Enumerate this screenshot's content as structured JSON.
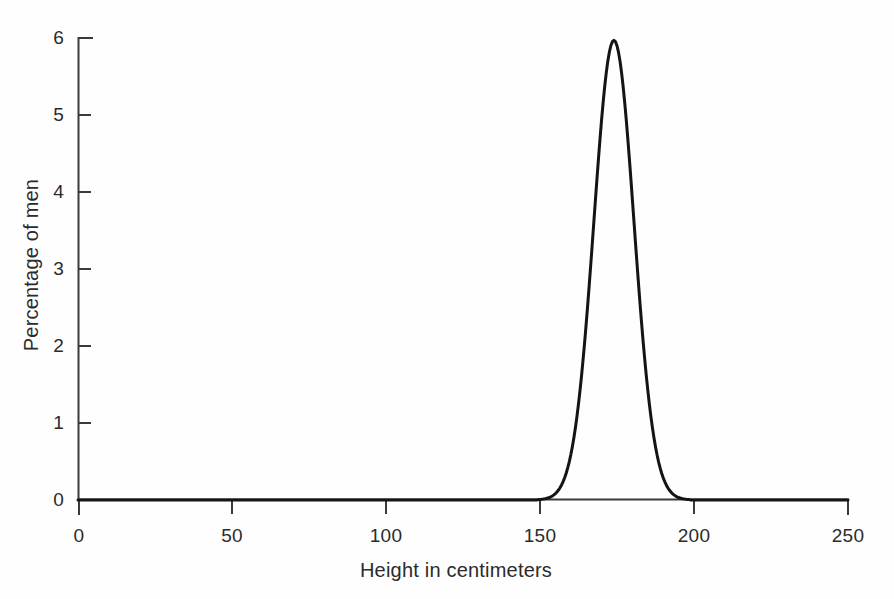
{
  "chart_data": {
    "type": "line",
    "title": "",
    "subtitle": "",
    "xlabel": "Height in centimeters",
    "ylabel": "Percentage of men",
    "xlim": [
      0,
      250
    ],
    "ylim": [
      0,
      6
    ],
    "xticks": [
      0,
      50,
      100,
      150,
      200,
      250
    ],
    "xtick_labels": [
      "0",
      "50",
      "100",
      "150",
      "200",
      "250"
    ],
    "yticks": [
      0,
      1,
      2,
      3,
      4,
      5,
      6
    ],
    "ytick_labels": [
      "0",
      "1",
      "2",
      "3",
      "4",
      "5",
      "6"
    ],
    "grid": false,
    "legend": false,
    "legend_position": "none",
    "annotations": [],
    "distribution": {
      "shape": "normal",
      "mean": 174,
      "std_dev": 6.5,
      "peak_value": 5.97,
      "peak_x": 174,
      "visible_support": [
        148,
        200
      ]
    },
    "series": [
      {
        "name": "Percentage of men by height",
        "color": "#141414",
        "line_width": 3,
        "x": [
          0,
          10,
          20,
          30,
          40,
          50,
          60,
          70,
          80,
          90,
          100,
          110,
          120,
          130,
          140,
          145,
          148,
          150,
          152,
          154,
          156,
          158,
          160,
          162,
          164,
          166,
          168,
          170,
          172,
          174,
          176,
          178,
          180,
          182,
          184,
          186,
          188,
          190,
          192,
          194,
          196,
          198,
          200,
          210,
          220,
          230,
          240,
          250
        ],
        "y": [
          0,
          0,
          0,
          0,
          0,
          0,
          0,
          0,
          0,
          0,
          0,
          0,
          0,
          0,
          0.01,
          0.02,
          0.03,
          0.06,
          0.11,
          0.2,
          0.33,
          0.55,
          0.87,
          1.32,
          1.94,
          2.7,
          3.56,
          4.43,
          5.2,
          5.75,
          5.97,
          5.86,
          5.43,
          4.75,
          3.93,
          3.1,
          2.33,
          1.67,
          1.15,
          0.75,
          0.47,
          0.28,
          0.16,
          0.01,
          0,
          0,
          0,
          0
        ]
      }
    ]
  },
  "axes": {
    "x_title": "Height in centimeters",
    "y_title": "Percentage of men",
    "x_tick_labels": [
      "0",
      "50",
      "100",
      "150",
      "200",
      "250"
    ],
    "y_tick_labels": [
      "0",
      "1",
      "2",
      "3",
      "4",
      "5",
      "6"
    ],
    "axis_color": "#3a3a3a",
    "curve_color": "#141414"
  }
}
